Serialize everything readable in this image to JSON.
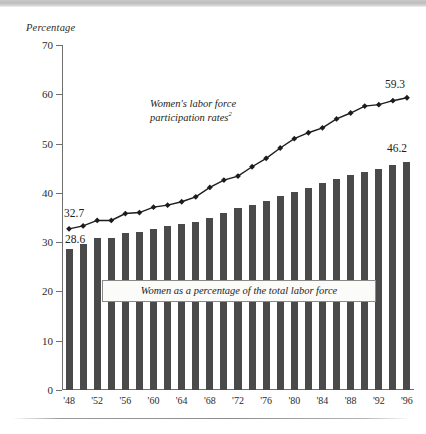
{
  "page": {
    "has_top_band": true,
    "has_bottom_rule": true,
    "background": "#ffffff"
  },
  "chart_data": {
    "type": "bar",
    "title": "",
    "subtitle": "",
    "xlabel": "",
    "ylabel": "Percentage",
    "ylim": [
      0,
      70
    ],
    "ytick_values": [
      0,
      10,
      20,
      30,
      40,
      50,
      60,
      70
    ],
    "ytick_labels": [
      "0",
      "10",
      "20",
      "30",
      "40",
      "50",
      "60",
      "70"
    ],
    "grid": false,
    "legend_position": "inline-annotations",
    "x": [
      1948,
      1950,
      1952,
      1954,
      1956,
      1958,
      1960,
      1962,
      1964,
      1966,
      1968,
      1970,
      1972,
      1974,
      1976,
      1978,
      1980,
      1982,
      1984,
      1986,
      1988,
      1990,
      1992,
      1994,
      1996
    ],
    "xtick_labels": [
      "'48",
      "'52",
      "'56",
      "'60",
      "'64",
      "'68",
      "'72",
      "'76",
      "'80",
      "'84",
      "'88",
      "'92",
      "'96"
    ],
    "xtick_years": [
      1948,
      1952,
      1956,
      1960,
      1964,
      1968,
      1972,
      1976,
      1980,
      1984,
      1988,
      1992,
      1996
    ],
    "series": [
      {
        "name": "Women as a percentage of the total labor force",
        "kind": "bar",
        "color": "#4a4a4a",
        "values": [
          28.6,
          29.6,
          30.8,
          30.8,
          31.9,
          32.1,
          32.7,
          33.2,
          33.7,
          34.1,
          35.0,
          35.9,
          36.9,
          37.6,
          38.4,
          39.3,
          40.1,
          41.0,
          42.0,
          42.9,
          43.6,
          44.3,
          44.9,
          45.6,
          46.2
        ],
        "first_label": "28.6",
        "last_label": "46.2"
      },
      {
        "name": "Women's labor force participation rates",
        "name_superscript": "2",
        "kind": "line",
        "color": "#1c1c1c",
        "marker": "diamond",
        "values": [
          32.7,
          33.3,
          34.4,
          34.4,
          35.8,
          36.0,
          37.1,
          37.5,
          38.2,
          39.2,
          41.1,
          42.6,
          43.4,
          45.3,
          47.0,
          49.1,
          51.0,
          52.2,
          53.2,
          55.0,
          56.2,
          57.6,
          57.9,
          58.7,
          59.3
        ],
        "first_label": "32.7",
        "last_label": "59.3"
      }
    ],
    "annotations": [
      {
        "id": "line-annotation",
        "text_line1": "Women's labor force",
        "text_line2": "participation rates",
        "superscript": "2"
      },
      {
        "id": "bar-callout",
        "text": "Women as a percentage of the total labor force"
      }
    ]
  }
}
